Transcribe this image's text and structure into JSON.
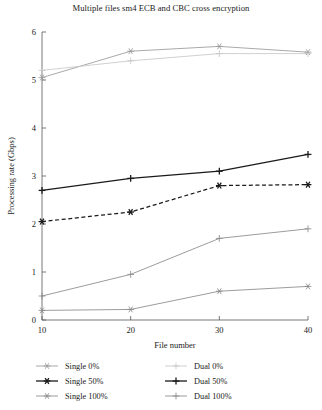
{
  "chart_data": {
    "type": "line",
    "title": "Multiple files sm4 ECB and CBC cross encryption",
    "xlabel": "File number",
    "ylabel": "Processing rate (Gbps)",
    "x": [
      10,
      20,
      30,
      40
    ],
    "xtick_labels": [
      "10",
      "20",
      "30",
      "40"
    ],
    "ytick_labels": [
      "0",
      "1",
      "2",
      "3",
      "4",
      "5",
      "6"
    ],
    "xlim": [
      10,
      40
    ],
    "ylim": [
      0,
      6
    ],
    "grid": false,
    "legend_position": "below-axes",
    "series": [
      {
        "name": "Single 0%",
        "marker": "asterisk",
        "style": "solid",
        "color": "#9a9a9a",
        "values": [
          5.05,
          5.6,
          5.7,
          5.58
        ]
      },
      {
        "name": "Single 50%",
        "marker": "asterisk",
        "style": "dashed",
        "color": "#1a1a1a",
        "values": [
          2.05,
          2.25,
          2.8,
          2.82
        ]
      },
      {
        "name": "Single 100%",
        "marker": "asterisk",
        "style": "solid",
        "color": "#8a8a8a",
        "values": [
          0.2,
          0.22,
          0.6,
          0.7
        ]
      },
      {
        "name": "Dual 0%",
        "marker": "plus",
        "style": "solid",
        "color": "#c8c8c8",
        "values": [
          5.2,
          5.4,
          5.55,
          5.55
        ]
      },
      {
        "name": "Dual 50%",
        "marker": "plus",
        "style": "solid",
        "color": "#1a1a1a",
        "values": [
          2.7,
          2.95,
          3.1,
          3.45
        ]
      },
      {
        "name": "Dual 100%",
        "marker": "plus",
        "style": "solid",
        "color": "#8a8a8a",
        "values": [
          0.5,
          0.95,
          1.7,
          1.9
        ]
      }
    ]
  },
  "legend": {
    "entries": [
      {
        "label": "Single 0%"
      },
      {
        "label": "Single 50%"
      },
      {
        "label": "Single 100%"
      },
      {
        "label": "Dual 0%"
      },
      {
        "label": "Dual 50%"
      },
      {
        "label": "Dual 100%"
      }
    ]
  }
}
